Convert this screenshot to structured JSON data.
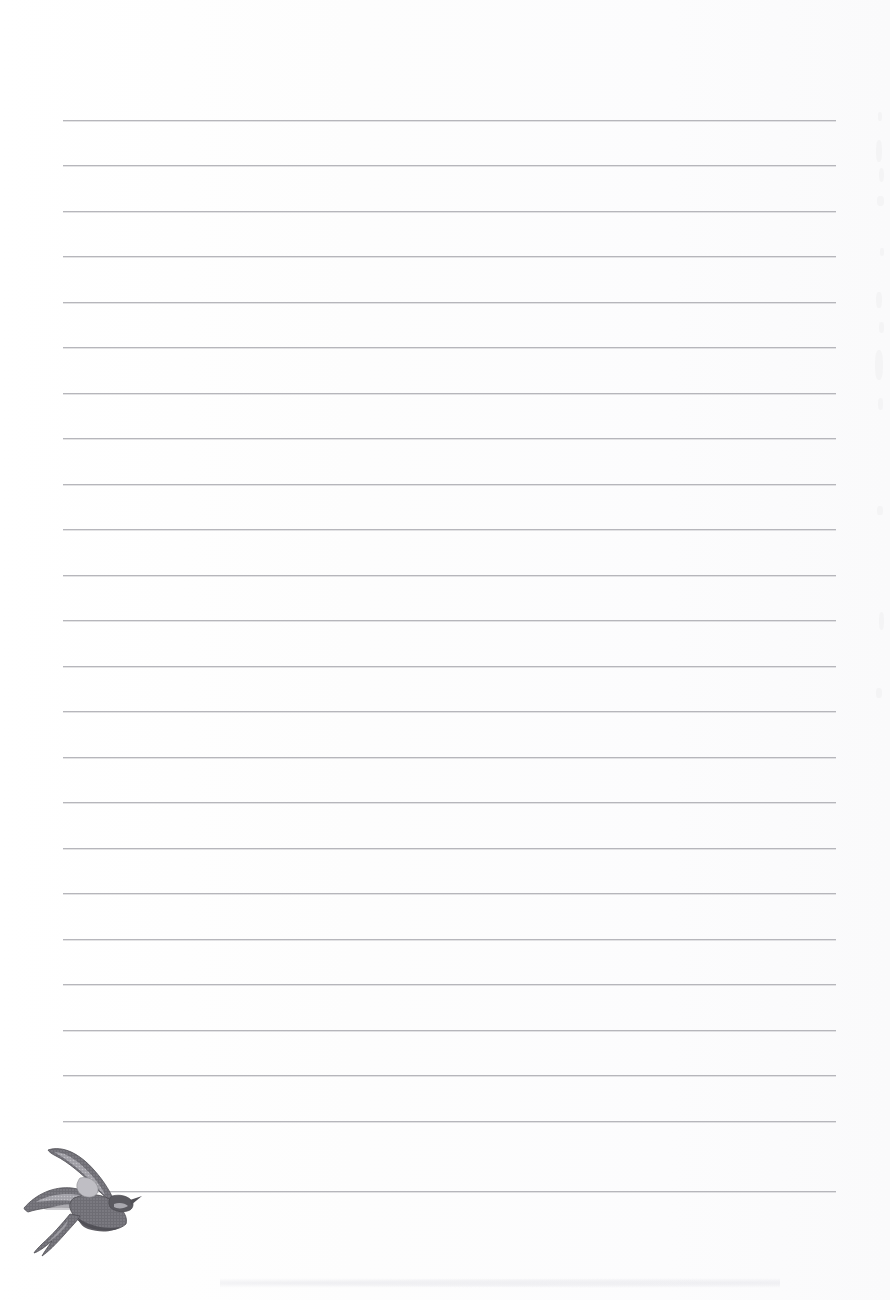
{
  "page": {
    "kind": "lined-notepaper",
    "width": 890,
    "height": 1300,
    "background_color": "#ffffff",
    "text_content": "",
    "note": "blank ruled writing sheet, no written text present"
  },
  "ruling": {
    "line_color": "#b3b3b8",
    "line_count": 24,
    "line_thickness_px": 1,
    "line_spacing_px": 45.5,
    "first_line_y": 120,
    "last_line_y": 1191,
    "left_margin_x": 63,
    "right_margin_x": 836,
    "line_length_px": 773,
    "y_positions": [
      120,
      165,
      211,
      256,
      302,
      347,
      393,
      438,
      484,
      529,
      575,
      620,
      666,
      711,
      757,
      802,
      848,
      893,
      939,
      984,
      1030,
      1075,
      1121,
      1191
    ]
  },
  "illustration": {
    "name": "swift-bird-in-flight",
    "subject": "swift / swallow bird in flight",
    "style": "vintage engraving halftone",
    "position": {
      "x": 18,
      "y": 1132,
      "width": 126,
      "height": 126
    },
    "colors": {
      "dark": "#55545a",
      "mid": "#76757c",
      "light": "#a9a8ae",
      "highlight": "#c9c8ce"
    },
    "caption": ""
  },
  "artifacts": {
    "right_margin_specks": [
      {
        "x": 878,
        "y": 112,
        "w": 4,
        "h": 9
      },
      {
        "x": 876,
        "y": 140,
        "w": 6,
        "h": 22
      },
      {
        "x": 879,
        "y": 168,
        "w": 5,
        "h": 14
      },
      {
        "x": 877,
        "y": 196,
        "w": 7,
        "h": 10
      },
      {
        "x": 880,
        "y": 248,
        "w": 4,
        "h": 8
      },
      {
        "x": 876,
        "y": 292,
        "w": 6,
        "h": 16
      },
      {
        "x": 879,
        "y": 322,
        "w": 5,
        "h": 11
      },
      {
        "x": 875,
        "y": 350,
        "w": 8,
        "h": 30
      },
      {
        "x": 878,
        "y": 398,
        "w": 5,
        "h": 12
      },
      {
        "x": 877,
        "y": 506,
        "w": 6,
        "h": 9
      },
      {
        "x": 879,
        "y": 612,
        "w": 5,
        "h": 18
      },
      {
        "x": 876,
        "y": 688,
        "w": 6,
        "h": 10
      }
    ],
    "bottom_smudge": {
      "x": 220,
      "y": 1278,
      "w": 560,
      "h": 10
    }
  }
}
